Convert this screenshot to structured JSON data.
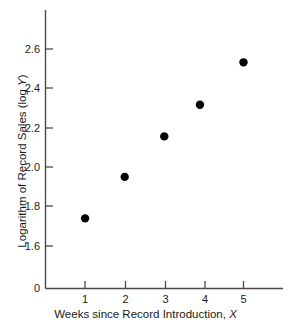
{
  "chart_data": {
    "type": "scatter",
    "title": "",
    "subtitle": "",
    "xlabel": "Weeks since Record Introduction, X",
    "xlabel_text": "Weeks since Record Introduction, ",
    "xlabel_var": "X",
    "ylabel": "Logarithm of Record Sales (log Y)",
    "ylabel_text": "Logarithm of Record Sales (log ",
    "ylabel_var": "Y",
    "ylabel_tail": ")",
    "x": [
      1,
      2,
      3,
      3.9,
      5
    ],
    "y": [
      1.74,
      1.95,
      2.155,
      2.315,
      2.53
    ],
    "points": [
      {
        "x": 1,
        "y": 1.74
      },
      {
        "x": 2,
        "y": 1.95
      },
      {
        "x": 3,
        "y": 2.155
      },
      {
        "x": 3.9,
        "y": 2.315
      },
      {
        "x": 5,
        "y": 2.53
      }
    ],
    "xticks": [
      1,
      2,
      3,
      4,
      5
    ],
    "xtick_labels": [
      "1",
      "2",
      "3",
      "4",
      "5"
    ],
    "yticks": [
      1.6,
      1.8,
      2.0,
      2.2,
      2.4,
      2.6
    ],
    "ytick_labels": [
      "1.6",
      "1.8",
      "2.0",
      "2.2",
      "2.4",
      "2.6"
    ],
    "origin_label": "0",
    "xlim": [
      0.4,
      6.0
    ],
    "ylim": [
      1.5,
      2.72
    ],
    "grid": false,
    "legend": null,
    "marker": "filled-circle",
    "marker_color": "#000000",
    "axis_color": "#4a4a4a",
    "background_color": "#ffffff"
  },
  "axis_titles": {
    "x_prefix": "Weeks since Record Introduction, ",
    "x_var": "X",
    "y_prefix": "Logarithm of Record Sales (log ",
    "y_var": "Y",
    "y_suffix": ")"
  },
  "ytick_labels": {
    "t0": "2.6",
    "t1": "2.4",
    "t2": "2.2",
    "t3": "2.0",
    "t4": "1.8",
    "t5": "1.6",
    "t6": "0"
  },
  "xtick_labels": {
    "t0": "1",
    "t1": "2",
    "t2": "3",
    "t3": "4",
    "t4": "5"
  }
}
